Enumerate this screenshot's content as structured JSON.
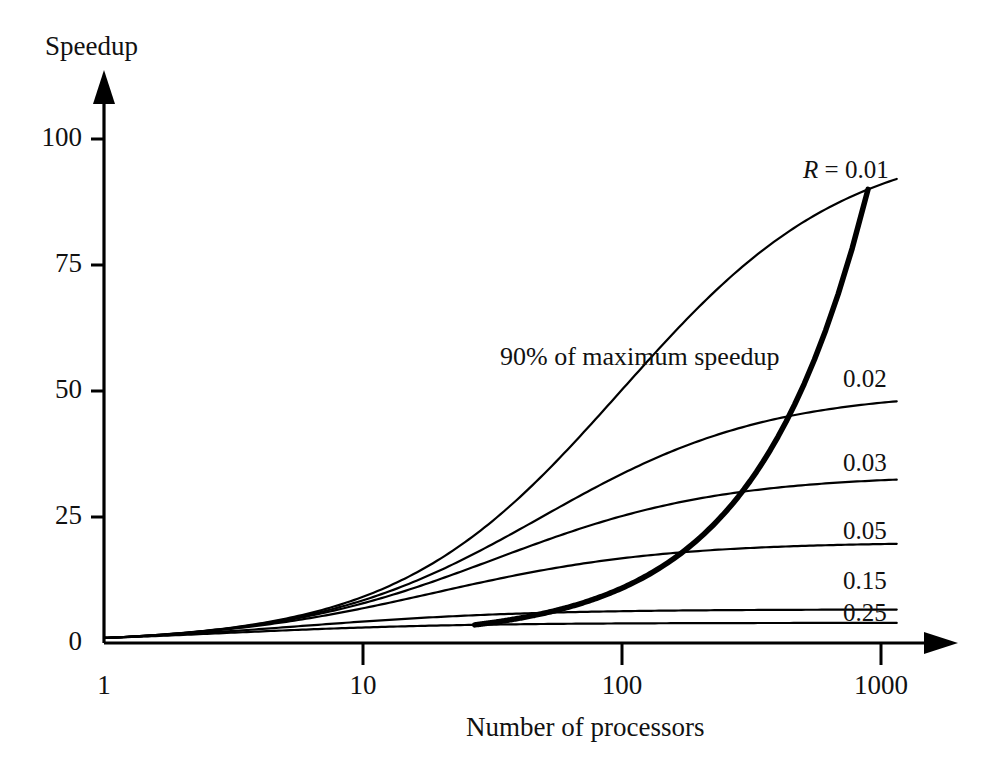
{
  "chart_data": {
    "type": "line",
    "title": "",
    "xlabel": "Number of processors",
    "ylabel": "Speedup",
    "xscale": "log",
    "yscale": "linear",
    "xlim": [
      1,
      1300
    ],
    "ylim": [
      0,
      115
    ],
    "xticks": [
      "1",
      "10",
      "100",
      "1000"
    ],
    "xtick_values": [
      1,
      10,
      100,
      1000
    ],
    "yticks": [
      "0",
      "25",
      "50",
      "75",
      "100"
    ],
    "ytick_values": [
      0,
      25,
      50,
      75,
      100
    ],
    "grid": false,
    "legend_position": "inline-right",
    "formula": "S(p) = p / (1 + R*(p-1))",
    "series": [
      {
        "name": "R = 0.01",
        "label": "R = 0.01",
        "R": 0.01,
        "asymptote": 100,
        "x": [
          1,
          2,
          3,
          5,
          8,
          12,
          20,
          32,
          50,
          80,
          125,
          200,
          320,
          500,
          800,
          1150
        ],
        "values": [
          1,
          1.98,
          2.94,
          4.81,
          7.48,
          10.71,
          16.81,
          24.81,
          33.56,
          44.69,
          55.56,
          66.89,
          76.19,
          83.47,
          88.99,
          91.99
        ]
      },
      {
        "name": "0.02",
        "label": "0.02",
        "R": 0.02,
        "asymptote": 50,
        "x": [
          1,
          2,
          3,
          5,
          8,
          12,
          20,
          32,
          50,
          80,
          125,
          200,
          320,
          500,
          800,
          1150
        ],
        "values": [
          1,
          1.96,
          2.88,
          4.63,
          7.02,
          9.84,
          14.71,
          20.51,
          26.04,
          32.0,
          36.93,
          41.67,
          45.11,
          47.57,
          49.26,
          50.07
        ]
      },
      {
        "name": "0.03",
        "label": "0.03",
        "R": 0.03,
        "asymptote": 33.3,
        "x": [
          1,
          2,
          3,
          5,
          8,
          12,
          20,
          32,
          50,
          80,
          125,
          200,
          320,
          500,
          800,
          1150
        ],
        "values": [
          1,
          1.94,
          2.83,
          4.46,
          6.61,
          9.09,
          13.12,
          17.6,
          21.55,
          25.48,
          28.41,
          31.01,
          32.77,
          33.96,
          34.74,
          35.1
        ]
      },
      {
        "name": "0.05",
        "label": "0.05",
        "R": 0.05,
        "asymptote": 20,
        "x": [
          1,
          2,
          3,
          5,
          8,
          12,
          20,
          32,
          50,
          80,
          125,
          200,
          320,
          500,
          800,
          1150
        ],
        "values": [
          1,
          1.9,
          2.73,
          4.17,
          5.93,
          7.77,
          10.53,
          13.17,
          15.27,
          17.14,
          18.42,
          19.48,
          20.16,
          20.6,
          20.88,
          21.01
        ]
      },
      {
        "name": "0.15",
        "label": "0.15",
        "R": 0.15,
        "asymptote": 6.67,
        "x": [
          1,
          2,
          3,
          5,
          8,
          12,
          20,
          32,
          50,
          80,
          125,
          200,
          320,
          500,
          800,
          1150
        ],
        "values": [
          1,
          1.74,
          2.31,
          3.08,
          3.81,
          4.36,
          4.97,
          5.44,
          5.77,
          6.02,
          6.17,
          6.3,
          6.39,
          6.44,
          6.47,
          6.49
        ]
      },
      {
        "name": "0.25",
        "label": "0.25",
        "R": 0.25,
        "asymptote": 4,
        "x": [
          1,
          2,
          3,
          5,
          8,
          12,
          20,
          32,
          50,
          80,
          125,
          200,
          320,
          500,
          800,
          1150
        ],
        "values": [
          1,
          1.6,
          2.0,
          2.5,
          2.91,
          3.2,
          3.48,
          3.67,
          3.78,
          3.86,
          3.91,
          3.94,
          3.96,
          3.97,
          3.98,
          3.99
        ]
      },
      {
        "name": "90% of maximum speedup",
        "label": "90% of maximum speedup",
        "emphasis": true,
        "description": "locus of points where each R curve reaches 90% of its asymptotic maximum speedup 1/R",
        "x": [
          24,
          36,
          60,
          91,
          100,
          181,
          271,
          460,
          640,
          901
        ],
        "values": [
          3.6,
          6.0,
          9.0,
          13.5,
          15.0,
          22.5,
          30.0,
          45.0,
          60.0,
          90.0
        ]
      }
    ],
    "annotations": [
      {
        "text": "90% of maximum speedup",
        "x_px": 500,
        "y_px": 357
      },
      {
        "text": "R = 0.01",
        "x_px": 803,
        "y_px": 170
      },
      {
        "text": "0.02",
        "x_px": 843,
        "y_px": 379
      },
      {
        "text": "0.03",
        "x_px": 843,
        "y_px": 463
      },
      {
        "text": "0.05",
        "x_px": 843,
        "y_px": 531
      },
      {
        "text": "0.15",
        "x_px": 843,
        "y_px": 581
      },
      {
        "text": "0.25",
        "x_px": 843,
        "y_px": 613
      }
    ]
  },
  "axes": {
    "y_title": "Speedup",
    "x_title": "Number of processors",
    "y_tick_labels": [
      "100",
      "75",
      "50",
      "25",
      "0"
    ],
    "x_tick_labels": [
      "1",
      "10",
      "100",
      "1000"
    ]
  },
  "series_labels": {
    "r001_prefix": "R",
    "r001_eq": " = 0.01",
    "r002": "0.02",
    "r003": "0.03",
    "r005": "0.05",
    "r015": "0.15",
    "r025": "0.25"
  },
  "annotation_text": {
    "ninety_percent": "90% of maximum speedup"
  },
  "colors": {
    "line": "#000000",
    "axis": "#000000",
    "background": "#ffffff"
  }
}
